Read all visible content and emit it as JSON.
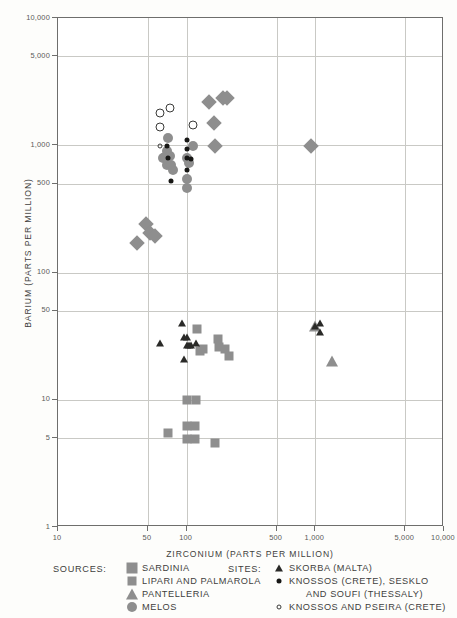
{
  "chart_data": {
    "type": "scatter",
    "title": "",
    "xlabel": "ZIRCONIUM (PARTS PER MILLION)",
    "ylabel": "BARIUM (PARTS PER MILLION)",
    "xscale": "log",
    "yscale": "log",
    "xlim": [
      10,
      10000
    ],
    "ylim": [
      1,
      10000
    ],
    "grid": true,
    "xticks": [
      10,
      50,
      100,
      500,
      1000,
      5000,
      10000
    ],
    "xtick_labels": [
      "10",
      "50",
      "100",
      "500",
      "1,000",
      "5,000",
      "10,000"
    ],
    "yticks": [
      1,
      5,
      10,
      50,
      100,
      500,
      1000,
      5000,
      10000
    ],
    "ytick_labels": [
      "1",
      "5",
      "10",
      "50",
      "100",
      "500",
      "1,000",
      "5,000",
      "10,000"
    ],
    "legend_position": "below-plot",
    "series": [
      {
        "name": "SARDINIA",
        "group": "SOURCES",
        "marker": "diamond",
        "color": "#8e8e8e",
        "points": [
          [
            41,
            170
          ],
          [
            48,
            240
          ],
          [
            52,
            205
          ],
          [
            57,
            195
          ],
          [
            150,
            2200
          ],
          [
            163,
            1500
          ],
          [
            190,
            2350
          ],
          [
            205,
            2350
          ],
          [
            165,
            980
          ],
          [
            920,
            980
          ]
        ]
      },
      {
        "name": "LIPARI AND PALMAROLA",
        "group": "SOURCES",
        "marker": "square",
        "color": "#8e8e8e",
        "points": [
          [
            120,
            36
          ],
          [
            128,
            24
          ],
          [
            135,
            25
          ],
          [
            175,
            30
          ],
          [
            178,
            26
          ],
          [
            200,
            25
          ],
          [
            215,
            22
          ],
          [
            100,
            10
          ],
          [
            118,
            10
          ],
          [
            72,
            5.5
          ],
          [
            100,
            6.2
          ],
          [
            116,
            6.2
          ],
          [
            100,
            4.9
          ],
          [
            116,
            4.9
          ],
          [
            165,
            4.6
          ]
        ]
      },
      {
        "name": "PANTELLERIA",
        "group": "SOURCES",
        "marker": "triangle",
        "color": "#8e8e8e",
        "points": [
          [
            1000,
            38
          ],
          [
            1350,
            20
          ]
        ]
      },
      {
        "name": "MELOS",
        "group": "SOURCES",
        "marker": "circle",
        "color": "#8e8e8e",
        "points": [
          [
            72,
            1150
          ],
          [
            70,
            900
          ],
          [
            68,
            810
          ],
          [
            66,
            790
          ],
          [
            70,
            700
          ],
          [
            74,
            820
          ],
          [
            76,
            700
          ],
          [
            78,
            640
          ],
          [
            100,
            790
          ],
          [
            104,
            720
          ],
          [
            100,
            540
          ],
          [
            100,
            460
          ],
          [
            112,
            980
          ]
        ]
      },
      {
        "name": "SKORBA (MALTA)",
        "group": "SITES",
        "marker": "triangle-small",
        "color": "#2a2a28",
        "points": [
          [
            62,
            28
          ],
          [
            92,
            40
          ],
          [
            96,
            31
          ],
          [
            100,
            31
          ],
          [
            100,
            27
          ],
          [
            105,
            27
          ],
          [
            108,
            27
          ],
          [
            118,
            28
          ],
          [
            96,
            21
          ],
          [
            1000,
            38
          ],
          [
            1080,
            40
          ],
          [
            1080,
            34
          ]
        ]
      },
      {
        "name": "KNOSSOS (CRETE), SESKLO AND SOUFI (THESSALY)",
        "group": "SITES",
        "marker": "dot",
        "color": "#17171 5",
        "points": [
          [
            70,
            990
          ],
          [
            72,
            800
          ],
          [
            100,
            1090
          ],
          [
            100,
            940
          ],
          [
            100,
            790
          ],
          [
            108,
            780
          ],
          [
            100,
            640
          ],
          [
            76,
            520
          ]
        ]
      },
      {
        "name": "KNOSSOS AND PSEIRA (CRETE)",
        "group": "SITES",
        "marker": "open-circle",
        "color": "#3a3a38",
        "points": [
          [
            62,
            1800
          ],
          [
            62,
            1400
          ],
          [
            74,
            1950
          ],
          [
            112,
            1450
          ],
          [
            62,
            980
          ]
        ]
      }
    ]
  },
  "legend": {
    "sources_heading": "SOURCES:",
    "sites_heading": "SITES:",
    "sources": [
      {
        "label": "SARDINIA",
        "marker": "diamond"
      },
      {
        "label": "LIPARI AND PALMAROLA",
        "marker": "square"
      },
      {
        "label": "PANTELLERIA",
        "marker": "triangle"
      },
      {
        "label": "MELOS",
        "marker": "circle"
      }
    ],
    "sites": [
      {
        "label": "SKORBA (MALTA)",
        "marker": "triangle-small"
      },
      {
        "label": "KNOSSOS (CRETE), SESKLO",
        "label2": "AND SOUFI  (THESSALY)",
        "marker": "dot"
      },
      {
        "label": "KNOSSOS AND PSEIRA (CRETE)",
        "marker": "open-circle"
      }
    ]
  },
  "colors": {
    "source_gray": "#8e8e8e",
    "site_black": "#17 1715",
    "grid": "#c9c9c5",
    "frame": "#6e6e6c"
  }
}
